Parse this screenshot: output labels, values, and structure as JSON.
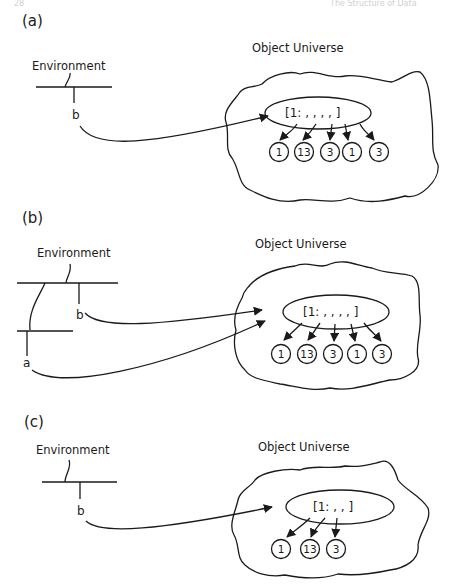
{
  "page": {
    "header_left": "28",
    "header_right": "The Structure of Data"
  },
  "panels": [
    {
      "label": "(a)",
      "environment_label": "Environment",
      "object_universe_label": "Object Universe",
      "variables": [
        "b"
      ],
      "array": {
        "text": "[1: , , , , ]",
        "values": [
          "1",
          "13",
          "3",
          "1",
          "3"
        ]
      }
    },
    {
      "label": "(b)",
      "environment_label": "Environment",
      "object_universe_label": "Object Universe",
      "variables": [
        "b",
        "a"
      ],
      "array": {
        "text": "[1: , , , , ]",
        "values": [
          "1",
          "13",
          "3",
          "1",
          "3"
        ]
      }
    },
    {
      "label": "(c)",
      "environment_label": "Environment",
      "object_universe_label": "Object Universe",
      "variables": [
        "b"
      ],
      "array": {
        "text": "[1: , , ]",
        "values": [
          "1",
          "13",
          "3"
        ]
      }
    }
  ],
  "colors": {
    "ink": "#1a1a1a",
    "background": "#ffffff"
  }
}
